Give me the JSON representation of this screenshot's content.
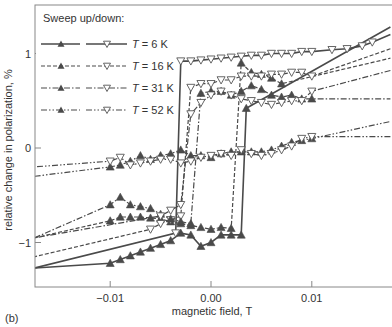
{
  "panel_label": "(b)",
  "chart_data": {
    "type": "line",
    "title": "",
    "xlabel": "magnetic field, T",
    "ylabel": "relative change in polarization, %",
    "xlim": [
      -0.0175,
      0.0178
    ],
    "ylim": [
      -1.45,
      1.5
    ],
    "x_ticks": [
      -0.01,
      0.0,
      0.01
    ],
    "x_tick_labels": [
      "-0.01",
      "0.00",
      "0.01"
    ],
    "y_ticks": [
      1,
      0,
      -1
    ],
    "y_tick_labels": [
      "1",
      "0",
      "-1"
    ],
    "grid": false,
    "legend": {
      "title": "Sweep up/down:",
      "position": "upper-left",
      "entries": [
        "T = 6 K",
        "T = 16 K",
        "T = 31 K",
        "T = 52 K"
      ]
    },
    "series": [
      {
        "name": "T = 6 K",
        "sweep": "up",
        "marker": "filled-triangle-up",
        "dash": "solid",
        "x": [
          -0.0175,
          -0.01,
          -0.009,
          -0.008,
          -0.007,
          -0.006,
          -0.005,
          -0.004,
          -0.003,
          -0.002,
          -0.001,
          0.0,
          0.001,
          0.002,
          0.003,
          0.0035,
          0.0178
        ],
        "y": [
          -1.27,
          -1.22,
          -1.18,
          -1.14,
          -1.1,
          -1.06,
          -1.02,
          -0.98,
          -0.9,
          -0.92,
          -1.04,
          -1.0,
          -0.92,
          -0.92,
          -0.92,
          0.42,
          1.28
        ]
      },
      {
        "name": "T = 6 K",
        "sweep": "down",
        "marker": "open-triangle-down",
        "dash": "solid",
        "x": [
          0.0178,
          0.016,
          0.015,
          0.0135,
          0.012,
          0.01,
          0.009,
          0.008,
          0.007,
          0.006,
          0.005,
          0.004,
          0.003,
          0.002,
          0.001,
          0.0,
          -0.001,
          -0.002,
          -0.003,
          -0.0035,
          -0.0175
        ],
        "y": [
          1.2,
          1.12,
          1.08,
          1.05,
          1.04,
          1.02,
          1.02,
          1.0,
          1.0,
          1.0,
          0.98,
          0.98,
          0.97,
          0.96,
          0.95,
          0.94,
          0.93,
          0.92,
          0.92,
          -0.9,
          -1.27
        ]
      },
      {
        "name": "T = 16 K",
        "sweep": "up",
        "marker": "filled-triangle-up",
        "dash": "dashed",
        "x": [
          -0.0175,
          -0.01,
          -0.009,
          -0.008,
          -0.007,
          -0.006,
          -0.005,
          -0.004,
          -0.003,
          -0.002,
          -0.001,
          0.0,
          0.001,
          0.002,
          0.003,
          0.004,
          0.005,
          0.006,
          0.007,
          0.0178
        ],
        "y": [
          -0.95,
          -0.77,
          -0.73,
          -0.73,
          -0.73,
          -0.74,
          -0.75,
          -0.78,
          -0.8,
          -0.82,
          -0.84,
          -0.86,
          -0.84,
          -0.85,
          0.9,
          0.8,
          0.78,
          0.74,
          0.68,
          0.95
        ]
      },
      {
        "name": "T = 16 K",
        "sweep": "down",
        "marker": "open-triangle-down",
        "dash": "dashed",
        "x": [
          0.0178,
          0.01,
          0.009,
          0.008,
          0.007,
          0.006,
          0.005,
          0.004,
          0.003,
          0.002,
          0.001,
          0.0,
          -0.001,
          -0.002,
          -0.003,
          -0.004,
          -0.005,
          -0.006,
          -0.0175
        ],
        "y": [
          1.05,
          0.76,
          0.8,
          0.8,
          0.78,
          0.78,
          0.76,
          0.76,
          0.76,
          0.72,
          0.72,
          0.68,
          0.68,
          0.64,
          -0.72,
          -0.76,
          -0.8,
          -0.86,
          -1.15
        ]
      },
      {
        "name": "T = 31 K",
        "sweep": "up",
        "marker": "filled-triangle-up",
        "dash": "dash-dot",
        "x": [
          -0.0175,
          -0.01,
          -0.009,
          -0.008,
          -0.007,
          -0.006,
          -0.005,
          -0.004,
          -0.003,
          -0.002,
          -0.001,
          0.0,
          0.001,
          0.002,
          0.003,
          0.004,
          0.005,
          0.006,
          0.007,
          0.008,
          0.009,
          0.01,
          0.0178
        ],
        "y": [
          -0.95,
          -0.6,
          -0.52,
          -0.6,
          -0.62,
          -0.64,
          -0.7,
          -0.75,
          -0.78,
          -0.8,
          0.58,
          0.6,
          0.6,
          0.56,
          0.6,
          0.66,
          0.62,
          0.56,
          0.54,
          0.56,
          0.52,
          0.52,
          0.52
        ]
      },
      {
        "name": "T = 31 K",
        "sweep": "down",
        "marker": "open-triangle-down",
        "dash": "dash-dot",
        "x": [
          0.0178,
          0.01,
          0.009,
          0.008,
          0.007,
          0.006,
          0.005,
          0.004,
          0.003,
          0.002,
          0.001,
          0.0,
          -0.001,
          -0.002,
          -0.003,
          -0.004,
          -0.005,
          -0.0175
        ],
        "y": [
          0.82,
          0.6,
          0.5,
          0.5,
          0.48,
          0.46,
          0.48,
          0.5,
          0.52,
          0.56,
          0.6,
          0.56,
          0.48,
          0.36,
          -0.6,
          -0.66,
          -0.72,
          -0.95
        ]
      },
      {
        "name": "T = 52 K",
        "sweep": "up",
        "marker": "filled-triangle-up",
        "dash": "dash-dot-dot",
        "x": [
          -0.0175,
          -0.01,
          -0.009,
          -0.008,
          -0.007,
          -0.006,
          -0.005,
          -0.004,
          -0.003,
          -0.002,
          -0.001,
          0.0,
          0.001,
          0.002,
          0.003,
          0.004,
          0.005,
          0.006,
          0.007,
          0.008,
          0.009,
          0.01,
          0.0178
        ],
        "y": [
          -0.3,
          -0.2,
          -0.18,
          -0.14,
          -0.08,
          -0.12,
          -0.08,
          -0.06,
          -0.02,
          -0.08,
          -0.08,
          -0.1,
          -0.06,
          -0.04,
          -0.04,
          -0.04,
          -0.04,
          -0.02,
          0.02,
          0.06,
          0.08,
          0.1,
          0.28
        ]
      },
      {
        "name": "T = 52 K",
        "sweep": "down",
        "marker": "open-triangle-down",
        "dash": "dash-dot-dot",
        "x": [
          0.0178,
          0.01,
          0.009,
          0.008,
          0.007,
          0.006,
          0.005,
          0.004,
          0.003,
          0.002,
          0.001,
          0.0,
          -0.001,
          -0.002,
          -0.003,
          -0.004,
          -0.005,
          -0.006,
          -0.007,
          -0.008,
          -0.009,
          -0.01,
          -0.0175
        ],
        "y": [
          0.12,
          0.12,
          0.1,
          0.02,
          -0.02,
          -0.06,
          -0.08,
          -0.06,
          -0.02,
          -0.08,
          -0.06,
          -0.08,
          -0.1,
          -0.14,
          -0.16,
          -0.12,
          -0.12,
          -0.14,
          -0.16,
          -0.18,
          -0.1,
          -0.14,
          -0.2
        ]
      }
    ]
  }
}
